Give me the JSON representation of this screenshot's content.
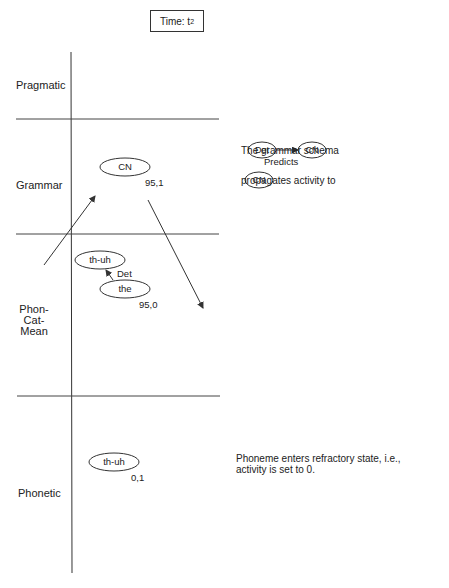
{
  "title": {
    "label": "Time: t",
    "subscript": "2"
  },
  "levels": [
    {
      "id": "pragmatic",
      "label": "Pragmatic"
    },
    {
      "id": "grammar",
      "label": "Grammar"
    },
    {
      "id": "phon-cat-mean",
      "label_lines": [
        "Phon-",
        "Cat-",
        "Mean"
      ]
    },
    {
      "id": "phonetic",
      "label": "Phonetic"
    }
  ],
  "nodes": {
    "grammar_cn": {
      "label": "CN",
      "value": "95,1"
    },
    "phon_th_uh": {
      "label": "th-uh"
    },
    "phon_det_link": {
      "label": "Det"
    },
    "phon_the": {
      "label": "the",
      "value": "95,0"
    },
    "phonetic_th_uh": {
      "label": "th-uh",
      "value": "0,1"
    }
  },
  "annotations": {
    "grammar": {
      "line1_prefix": "The grammar schema",
      "schema_from": "Det",
      "schema_edge": "Predicts",
      "schema_to": "CN",
      "line2_prefix": "propagates activity to",
      "target": "CN"
    },
    "phonetic": {
      "line1": "Phoneme enters refractory state, i.e.,",
      "line2": "activity is set to 0."
    }
  },
  "colors": {
    "line": "#333333",
    "text": "#222222",
    "background": "#ffffff"
  }
}
